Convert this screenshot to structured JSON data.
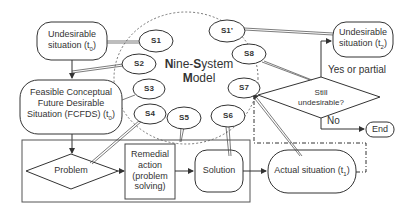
{
  "diagram": {
    "title_line1_prefix": "N",
    "title_line1_mid": "ine-",
    "title_line1_s": "S",
    "title_line1_rest": "ystem",
    "title_line2_prefix": "M",
    "title_line2_rest": "odel",
    "nodes": {
      "undesirable_t0": {
        "line1": "Undesirable",
        "line2": "situation (t",
        "sub": "0",
        "close": ")"
      },
      "fcfds": {
        "line1": "Feasible Conceptual",
        "line2": "Future Desirable",
        "line3": "Situation (FCFDS) (t",
        "sub": "0",
        "close": ")"
      },
      "problem": {
        "label": "Problem"
      },
      "remedial": {
        "line1": "Remedial",
        "line2": "action",
        "line3": "(problem",
        "line4": "solving)"
      },
      "solution": {
        "label": "Solution"
      },
      "actual": {
        "label": "Actual situation (t",
        "sub": "1",
        "close": ")"
      },
      "still_undesirable": {
        "line1": "Still",
        "line2": "undesirable?"
      },
      "undesirable_t2": {
        "line1": "Undesirable",
        "line2": "situation (t",
        "sub": "2",
        "close": ")"
      },
      "end": {
        "label": "End"
      }
    },
    "edge_labels": {
      "yes": "Yes or partial",
      "no": "No"
    },
    "callouts": {
      "s1": "S1",
      "s2": "S2",
      "s3": "S3",
      "s4": "S4",
      "s5": "S5",
      "s6": "S6",
      "s7": "S7",
      "s8": "S8",
      "s1p": "S1’"
    },
    "colors": {
      "stroke": "#3a3a3a",
      "text": "#333333",
      "background": "#ffffff"
    }
  }
}
